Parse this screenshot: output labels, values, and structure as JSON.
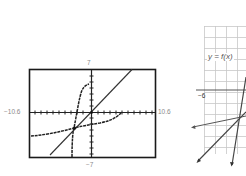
{
  "left_graph": {
    "type": "graphing-calculator-screen",
    "window": {
      "xmin_label": "−10.6",
      "xmax_label": "10.6",
      "ymax_label": "7",
      "ymin_label": "−7"
    },
    "xmin": -10.6,
    "xmax": 10.6,
    "ymin": -7,
    "ymax": 7,
    "curves": [
      "y = x (identity line)",
      "steep cubic-like curve f",
      "flat inverse curve f⁻¹"
    ]
  },
  "right_graph": {
    "type": "grid-graph",
    "function_label": "y = f(x)",
    "tick_label": "−6",
    "lines": 3
  },
  "colors": {
    "frame": "#1a1a1a",
    "curve": "#222222",
    "grid": "#c8c8c8",
    "label": "#8a8a8a"
  }
}
